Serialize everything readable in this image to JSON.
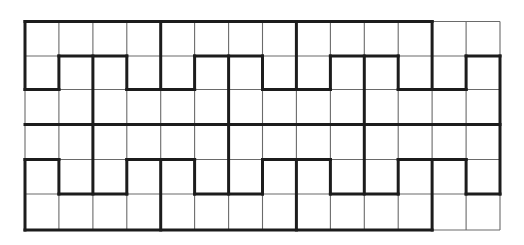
{
  "diagram": {
    "type": "grid-path-puzzle",
    "grid": {
      "columns": 14,
      "rows": 6,
      "col_x": [
        25,
        58.9,
        92.9,
        126.8,
        160.7,
        194.6,
        228.6,
        262.5,
        296.4,
        330.4,
        364.3,
        398.2,
        432.1,
        466.1,
        500
      ],
      "row_y": [
        21.5,
        56,
        89.5,
        124.5,
        159.5,
        194,
        230
      ]
    },
    "colors": {
      "background": "#ffffff",
      "thin_line": "#6a6a6a",
      "thick_line": "#1c1c1c"
    },
    "thick_horizontal": [
      {
        "row": 0,
        "from": 0,
        "to": 12
      },
      {
        "row": 1,
        "from": 1,
        "to": 3
      },
      {
        "row": 1,
        "from": 5,
        "to": 7
      },
      {
        "row": 1,
        "from": 9,
        "to": 11
      },
      {
        "row": 1,
        "from": 13,
        "to": 14
      },
      {
        "row": 2,
        "from": 0,
        "to": 1
      },
      {
        "row": 2,
        "from": 3,
        "to": 5
      },
      {
        "row": 2,
        "from": 7,
        "to": 9
      },
      {
        "row": 2,
        "from": 11,
        "to": 13
      },
      {
        "row": 3,
        "from": 0,
        "to": 14
      },
      {
        "row": 4,
        "from": 0,
        "to": 1
      },
      {
        "row": 4,
        "from": 3,
        "to": 5
      },
      {
        "row": 4,
        "from": 7,
        "to": 9
      },
      {
        "row": 4,
        "from": 11,
        "to": 13
      },
      {
        "row": 5,
        "from": 1,
        "to": 3
      },
      {
        "row": 5,
        "from": 5,
        "to": 7
      },
      {
        "row": 5,
        "from": 9,
        "to": 11
      },
      {
        "row": 5,
        "from": 13,
        "to": 14
      },
      {
        "row": 6,
        "from": 0,
        "to": 12
      }
    ],
    "thick_vertical": [
      {
        "col": 0,
        "from": 0,
        "to": 2
      },
      {
        "col": 0,
        "from": 4,
        "to": 6
      },
      {
        "col": 1,
        "from": 1,
        "to": 2
      },
      {
        "col": 1,
        "from": 4,
        "to": 5
      },
      {
        "col": 2,
        "from": 1,
        "to": 5
      },
      {
        "col": 3,
        "from": 1,
        "to": 2
      },
      {
        "col": 3,
        "from": 4,
        "to": 5
      },
      {
        "col": 4,
        "from": 0,
        "to": 2
      },
      {
        "col": 4,
        "from": 4,
        "to": 6
      },
      {
        "col": 5,
        "from": 1,
        "to": 2
      },
      {
        "col": 5,
        "from": 4,
        "to": 5
      },
      {
        "col": 6,
        "from": 1,
        "to": 5
      },
      {
        "col": 7,
        "from": 1,
        "to": 2
      },
      {
        "col": 7,
        "from": 4,
        "to": 5
      },
      {
        "col": 8,
        "from": 0,
        "to": 2
      },
      {
        "col": 8,
        "from": 4,
        "to": 6
      },
      {
        "col": 9,
        "from": 1,
        "to": 2
      },
      {
        "col": 9,
        "from": 4,
        "to": 5
      },
      {
        "col": 10,
        "from": 1,
        "to": 5
      },
      {
        "col": 11,
        "from": 1,
        "to": 2
      },
      {
        "col": 11,
        "from": 4,
        "to": 5
      },
      {
        "col": 12,
        "from": 0,
        "to": 2
      },
      {
        "col": 12,
        "from": 4,
        "to": 6
      },
      {
        "col": 13,
        "from": 1,
        "to": 2
      },
      {
        "col": 13,
        "from": 4,
        "to": 5
      },
      {
        "col": 14,
        "from": 1,
        "to": 5
      }
    ]
  }
}
